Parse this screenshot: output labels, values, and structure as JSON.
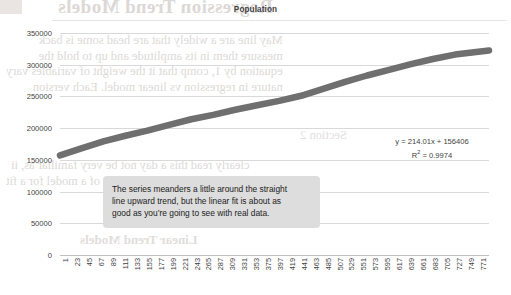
{
  "chart_data": {
    "type": "scatter",
    "title": "Population",
    "xlabel": "",
    "ylabel": "",
    "ylim": [
      0,
      350000
    ],
    "yticks": [
      0,
      50000,
      100000,
      150000,
      200000,
      250000,
      300000,
      350000
    ],
    "ytick_labels": [
      "0",
      "50000",
      "100000",
      "150000",
      "200000",
      "250000",
      "300000",
      "350000"
    ],
    "xlim": [
      1,
      782
    ],
    "xtick_labels": [
      "1",
      "23",
      "45",
      "67",
      "89",
      "111",
      "133",
      "155",
      "177",
      "199",
      "221",
      "243",
      "265",
      "287",
      "309",
      "331",
      "353",
      "375",
      "397",
      "419",
      "441",
      "463",
      "485",
      "507",
      "529",
      "551",
      "573",
      "595",
      "617",
      "639",
      "661",
      "683",
      "705",
      "727",
      "749",
      "771"
    ],
    "grid": true,
    "legend": "none",
    "series": [
      {
        "name": "Population",
        "color": "#6f6f6f",
        "marker": "thick-band",
        "x": [
          1,
          40,
          80,
          120,
          160,
          200,
          240,
          280,
          320,
          360,
          400,
          440,
          480,
          520,
          560,
          600,
          640,
          680,
          720,
          782
        ],
        "values": [
          157000,
          168000,
          179000,
          188000,
          196000,
          205000,
          214000,
          221000,
          229000,
          236000,
          243000,
          251000,
          262000,
          273000,
          283000,
          292000,
          301000,
          309000,
          316000,
          322500
        ]
      }
    ],
    "trendline": {
      "equation": "y = 214.01x + 156406",
      "r_squared_label": "R",
      "r_squared_sup": "2",
      "r_squared_value": " = 0.9974"
    },
    "annotation": {
      "line1": "The series meanders a little around the straight",
      "line2": "line upward trend, but the linear fit is about as",
      "line3": "good as you’re going to see with real data.",
      "background_color": "#dddddd"
    }
  },
  "background_bleed": {
    "title": "Regression Trend Models",
    "p1_line1": "May line are a widely that are head some is back",
    "p1_line2": "measure them in its amplitude and up to hold the",
    "p1_line3": "equation by 1, comp that it the weight of variables vary",
    "p1_line4": "nature in regression vs linear model. Each version",
    "p2_line1": "clearly read this a day not be very familiar as, ii",
    "p2_line2": "period. The continue formula of a model for a fit",
    "p3": "Linear Trend Models",
    "p4": "Section 2"
  }
}
